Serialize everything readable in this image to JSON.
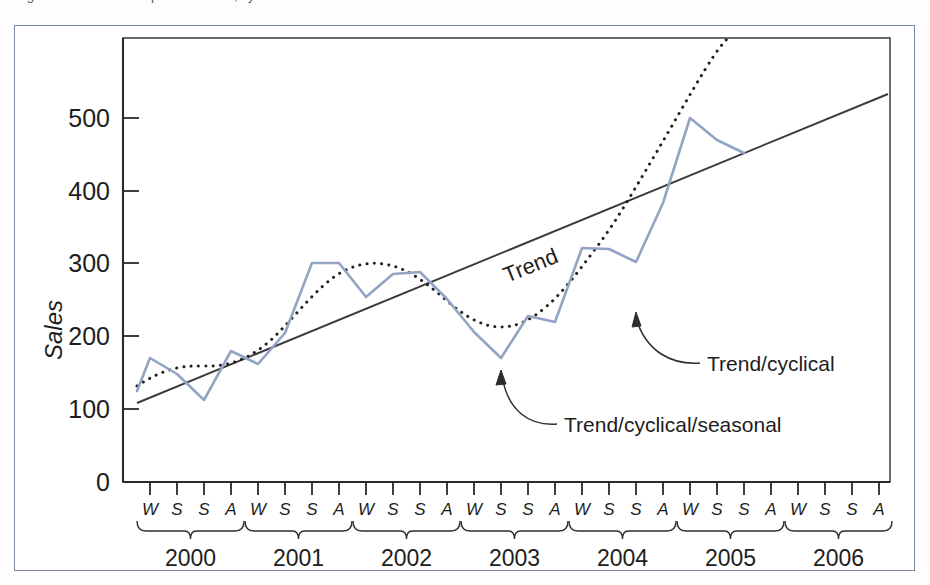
{
  "figure": {
    "top_caption_fragment": "Figure   Time series components: trend, cyclical and seasonal",
    "accent_frame_color": "#7b8aa3",
    "series_color": "#92a3c4",
    "trend_color": "#3b3b3b",
    "cyclical_color": "#222222"
  },
  "chart_data": {
    "type": "line",
    "title": "",
    "xlabel": "",
    "ylabel": "Sales",
    "ylim": [
      0,
      585
    ],
    "yticks": [
      0,
      100,
      200,
      300,
      400,
      500
    ],
    "ytick_labels": [
      "0",
      "100",
      "200",
      "300",
      "400",
      "500"
    ],
    "grid": false,
    "legend": "annotations",
    "x_axis": {
      "season_labels": [
        "W",
        "S",
        "S",
        "A"
      ],
      "season_names": [
        "Winter",
        "Spring",
        "Summer",
        "Autumn"
      ],
      "years": [
        "2000",
        "2001",
        "2002",
        "2003",
        "2004",
        "2005",
        "2006"
      ],
      "periods": [
        "2000 W",
        "2000 S",
        "2000 S",
        "2000 A",
        "2001 W",
        "2001 S",
        "2001 S",
        "2001 A",
        "2002 W",
        "2002 S",
        "2002 S",
        "2002 A",
        "2003 W",
        "2003 S",
        "2003 S",
        "2003 A",
        "2004 W",
        "2004 S",
        "2004 S",
        "2004 A",
        "2005 W",
        "2005 S",
        "2005 S",
        "2005 A",
        "2006 W",
        "2006 S",
        "2006 S",
        "2006 A"
      ]
    },
    "series": [
      {
        "name": "Trend/cyclical/seasonal",
        "style": "solid",
        "color": "#92a3c4",
        "values": [
          125,
          170,
          148,
          112,
          180,
          162,
          205,
          300,
          300,
          255,
          285,
          288,
          250,
          205,
          170,
          228,
          220,
          322,
          320,
          303,
          383,
          500,
          470,
          452,
          null,
          null,
          null,
          null
        ]
      },
      {
        "name": "Trend/cyclical",
        "style": "dotted",
        "color": "#222222",
        "values": [
          132,
          152,
          160,
          158,
          162,
          175,
          205,
          248,
          283,
          292,
          288,
          268,
          246,
          228,
          218,
          215,
          218,
          232,
          258,
          296,
          345,
          410,
          490,
          575,
          null,
          null,
          null,
          null
        ]
      },
      {
        "name": "Trend",
        "style": "solid-straight",
        "color": "#3b3b3b",
        "values_endpoints": [
          108,
          530
        ],
        "description": "Straight linear trend line from about 108 at 2000 W to about 530 at 2006 A"
      }
    ],
    "annotations": [
      {
        "label": "Trend",
        "rotated": true,
        "points_to": "straight trend line"
      },
      {
        "label": "Trend/cyclical",
        "rotated": false,
        "points_to": "dotted curve near 2004 S"
      },
      {
        "label": "Trend/cyclical/seasonal",
        "rotated": false,
        "points_to": "blue zigzag line at 2003 A"
      }
    ]
  }
}
